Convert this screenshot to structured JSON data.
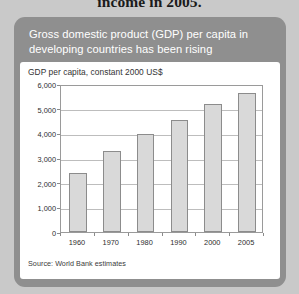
{
  "page_heading": "income in 2005.",
  "figure": {
    "title": "Gross domestic product (GDP) per capita in developing countries has been rising",
    "source": "Source: World Bank estimates",
    "card_color": "#8f8f8f",
    "panel_color": "#ffffff"
  },
  "chart_data": {
    "type": "bar",
    "title": "GDP per capita, constant 2000 US$",
    "xlabel": "",
    "ylabel": "",
    "categories": [
      "1960",
      "1970",
      "1980",
      "1990",
      "2000",
      "2005"
    ],
    "values": [
      2400,
      3300,
      3980,
      4550,
      5200,
      5620
    ],
    "ylim": [
      0,
      6000
    ],
    "yticks": [
      0,
      1000,
      2000,
      3000,
      4000,
      5000,
      6000
    ],
    "ytick_labels": [
      "0",
      "1,000",
      "2,000",
      "3,000",
      "4,000",
      "5,000",
      "6,000"
    ],
    "grid": true,
    "legend": false,
    "bar_color": "#d9d9d9",
    "bar_border_color": "#8c8c8c",
    "grid_color": "#bdbdbd",
    "source": "Source: World Bank estimates"
  }
}
